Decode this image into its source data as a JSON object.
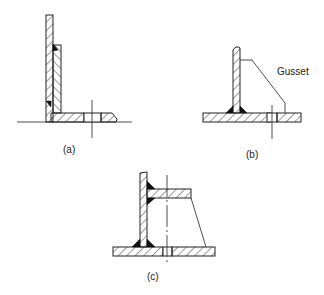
{
  "figure": {
    "type": "engineering-weld-joint-diagram",
    "panels": [
      {
        "id": "a",
        "label": "(a)",
        "description": "Vertical plate welded to base with thickened reinforcement and horizontal flange with bolt hole"
      },
      {
        "id": "b",
        "label": "(b)",
        "description": "Vertical plate fillet-welded to base plate with gusset support",
        "callout": "Gusset"
      },
      {
        "id": "c",
        "label": "(c)",
        "description": "Vertical plate with upper horizontal plate and base plate joined by tapered support"
      }
    ]
  },
  "labels": {
    "a": "(a)",
    "b": "(b)",
    "c": "(c)",
    "gusset": "Gusset"
  },
  "colors": {
    "line": "#222222",
    "weld": "#111111",
    "background": "#ffffff"
  }
}
